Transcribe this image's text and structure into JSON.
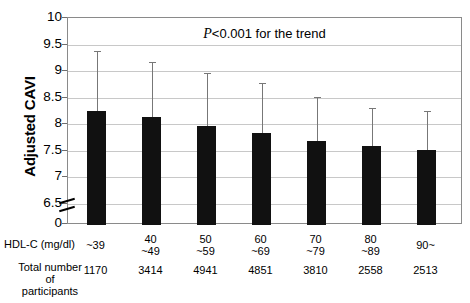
{
  "chart_data": {
    "type": "bar",
    "title": "",
    "annotation": "P<0.001 for the trend",
    "annotation_prefix": "P",
    "annotation_rest": "<0.001 for the trend",
    "xlabel": "HDL-C (mg/dl)",
    "ylabel": "Adjusted CAVI",
    "ylim": [
      6.5,
      10
    ],
    "y_ticks": [
      10,
      9.5,
      9,
      8.5,
      8,
      7.5,
      7,
      6.5,
      0
    ],
    "y_tick_labels": [
      "10",
      "9.5",
      "9",
      "8.5",
      "8",
      "7.5",
      "7",
      "6.5",
      "0"
    ],
    "axis_break": true,
    "grid": true,
    "legend": "none",
    "categories": [
      "~39",
      "40\n~49",
      "50\n~59",
      "60\n~69",
      "70\n~79",
      "80\n~89",
      "90~"
    ],
    "values": [
      8.25,
      8.13,
      7.96,
      7.83,
      7.69,
      7.59,
      7.52
    ],
    "error_high": [
      9.37,
      9.17,
      8.97,
      8.78,
      8.52,
      8.3,
      8.25
    ],
    "series": [
      {
        "name": "Adjusted CAVI",
        "values": [
          8.25,
          8.13,
          7.96,
          7.83,
          7.69,
          7.59,
          7.52
        ]
      }
    ],
    "bars": [
      {
        "category_line1": "~39",
        "category_line2": "",
        "value": 8.25,
        "error_high": 9.37,
        "participants": "1170"
      },
      {
        "category_line1": "40",
        "category_line2": "~49",
        "value": 8.13,
        "error_high": 9.17,
        "participants": "3414"
      },
      {
        "category_line1": "50",
        "category_line2": "~59",
        "value": 7.96,
        "error_high": 8.97,
        "participants": "4941"
      },
      {
        "category_line1": "60",
        "category_line2": "~69",
        "value": 7.83,
        "error_high": 8.78,
        "participants": "4851"
      },
      {
        "category_line1": "70",
        "category_line2": "~79",
        "value": 7.69,
        "error_high": 8.52,
        "participants": "3810"
      },
      {
        "category_line1": "80",
        "category_line2": "~89",
        "value": 7.59,
        "error_high": 8.3,
        "participants": "2558"
      },
      {
        "category_line1": "90~",
        "category_line2": "",
        "value": 7.52,
        "error_high": 8.25,
        "participants": "2513"
      }
    ],
    "row_labels": {
      "hdl": "HDL-C (mg/dl)",
      "total_line1": "Total number",
      "total_line2": "of",
      "total_line3": "participants"
    },
    "colors": {
      "bar": "#111111",
      "error": "#777777",
      "grid": "#c8c8c8",
      "frame": "#8a8a8a",
      "background": "#ffffff",
      "text": "#000000"
    }
  }
}
